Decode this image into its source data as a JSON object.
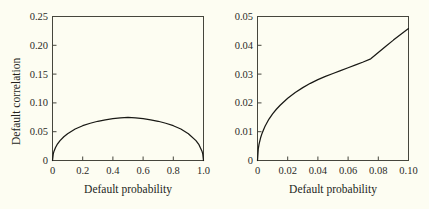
{
  "figure": {
    "background_color": "#fdfdf2",
    "line_color": "#1a1a1a",
    "axis_color": "#3d3d36"
  },
  "chart_data": [
    {
      "type": "line",
      "title": "",
      "xlabel": "Default probability",
      "ylabel": "Default correlation",
      "xlim": [
        0,
        1.0
      ],
      "ylim": [
        0,
        0.25
      ],
      "grid": false,
      "legend": null,
      "xticks": [
        0,
        0.2,
        0.4,
        0.6,
        0.8,
        1.0
      ],
      "xticklabels": [
        "0",
        "0.2",
        "0.4",
        "0.6",
        "0.8",
        "1.0"
      ],
      "yticks": [
        0,
        0.05,
        0.1,
        0.15,
        0.2,
        0.25
      ],
      "yticklabels": [
        "0",
        "0.05",
        "0.10",
        "0.15",
        "0.20",
        "0.25"
      ],
      "series": [
        {
          "name": "Default correlation",
          "x": [
            0.0,
            0.005,
            0.01,
            0.02,
            0.03,
            0.05,
            0.075,
            0.1,
            0.15,
            0.2,
            0.25,
            0.3,
            0.35,
            0.4,
            0.45,
            0.5,
            0.55,
            0.6,
            0.65,
            0.7,
            0.75,
            0.8,
            0.85,
            0.9,
            0.95,
            0.97,
            0.99,
            0.995,
            1.0
          ],
          "y": [
            0.0,
            0.0115,
            0.0162,
            0.0226,
            0.0274,
            0.0345,
            0.0413,
            0.0465,
            0.0546,
            0.0604,
            0.0647,
            0.0681,
            0.0707,
            0.0727,
            0.0742,
            0.075,
            0.0742,
            0.0727,
            0.0707,
            0.0681,
            0.0647,
            0.0604,
            0.0546,
            0.0465,
            0.0345,
            0.0274,
            0.0162,
            0.0115,
            0.0
          ]
        }
      ]
    },
    {
      "type": "line",
      "title": "",
      "xlabel": "Default probability",
      "ylabel": "",
      "xlim": [
        0,
        0.1
      ],
      "ylim": [
        0,
        0.05
      ],
      "grid": false,
      "legend": null,
      "xticks": [
        0,
        0.02,
        0.04,
        0.06,
        0.08,
        0.1
      ],
      "xticklabels": [
        "0",
        "0.02",
        "0.04",
        "0.06",
        "0.08",
        "0.10"
      ],
      "yticks": [
        0,
        0.01,
        0.02,
        0.03,
        0.04,
        0.05
      ],
      "yticklabels": [
        "0",
        "0.01",
        "0.02",
        "0.03",
        "0.04",
        "0.05"
      ],
      "series": [
        {
          "name": "Default correlation",
          "x": [
            0.0,
            0.0005,
            0.001,
            0.002,
            0.003,
            0.004,
            0.005,
            0.0075,
            0.01,
            0.0125,
            0.015,
            0.02,
            0.025,
            0.03,
            0.035,
            0.04,
            0.045,
            0.05,
            0.055,
            0.06,
            0.065,
            0.07,
            0.075,
            0.08,
            0.085,
            0.09,
            0.095,
            0.1
          ],
          "y": [
            0.0,
            0.004,
            0.0056,
            0.0078,
            0.0094,
            0.0107,
            0.0119,
            0.0143,
            0.0162,
            0.0178,
            0.0192,
            0.0216,
            0.0236,
            0.0253,
            0.0268,
            0.0281,
            0.0292,
            0.0302,
            0.0312,
            0.0322,
            0.0332,
            0.0342,
            0.0353,
            0.0375,
            0.0397,
            0.0418,
            0.0438,
            0.0458
          ]
        }
      ]
    }
  ],
  "panels": {
    "left": {
      "x_axis_title": "Default probability",
      "y_axis_title": "Default correlation",
      "xticklabels": [
        "0",
        "0.2",
        "0.4",
        "0.6",
        "0.8",
        "1.0"
      ],
      "yticklabels": [
        "0",
        "0.05",
        "0.10",
        "0.15",
        "0.20",
        "0.25"
      ]
    },
    "right": {
      "x_axis_title": "Default probability",
      "y_axis_title": "",
      "xticklabels": [
        "0",
        "0.02",
        "0.04",
        "0.06",
        "0.08",
        "0.10"
      ],
      "yticklabels": [
        "0",
        "0.01",
        "0.02",
        "0.03",
        "0.04",
        "0.05"
      ]
    }
  }
}
